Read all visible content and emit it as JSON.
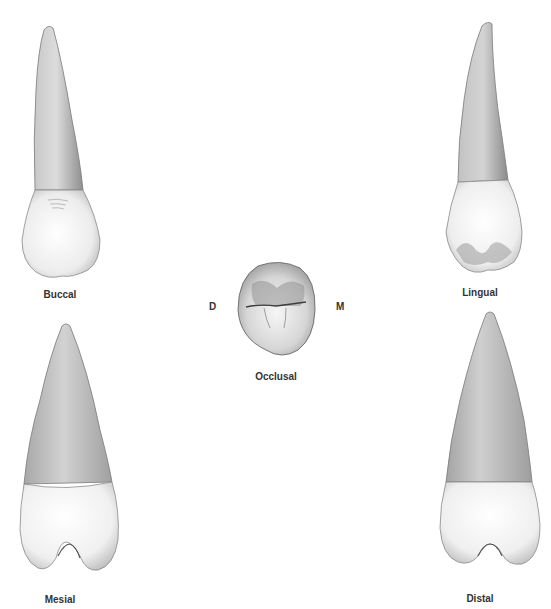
{
  "figure": {
    "views": [
      {
        "id": "buccal",
        "label": "Buccal"
      },
      {
        "id": "lingual",
        "label": "Lingual"
      },
      {
        "id": "occlusal",
        "label": "Occlusal"
      },
      {
        "id": "mesial",
        "label": "Mesial"
      },
      {
        "id": "distal",
        "label": "Distal"
      }
    ],
    "orientation": {
      "left": "D",
      "right": "M"
    }
  },
  "colors": {
    "background": "#ffffff",
    "root_light": "#d8d8d8",
    "root_dark": "#9a9a9a",
    "crown_light": "#f8f8f8",
    "crown_dark": "#c4c4c4",
    "outline": "#6a6a6a",
    "label": "#333333"
  }
}
